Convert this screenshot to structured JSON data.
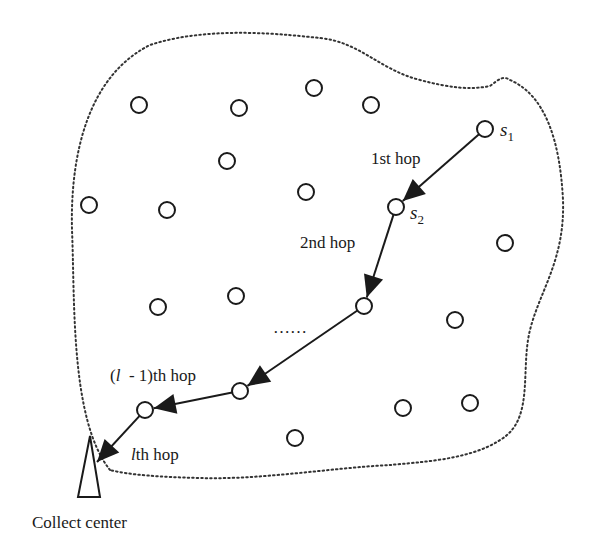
{
  "diagram": {
    "colors": {
      "background": "#ffffff",
      "stroke": "#1a1a1a",
      "boundary": "#333333"
    },
    "boundary": {
      "style": "dotted",
      "path": "M 110 470 C 70 420, 75 300, 72 230 C 70 150, 90 75, 150 45 C 210 25, 290 35, 320 38 C 360 42, 380 70, 420 80 C 450 88, 470 90, 490 86 C 498 80, 503 75, 510 80 C 545 95, 560 140, 563 200 C 565 260, 540 290, 530 330 C 520 370, 535 420, 500 440 C 470 460, 420 462, 390 465 C 330 468, 260 480, 200 478 C 160 477, 130 475, 110 470 Z"
    },
    "nodes": [
      {
        "id": "n1",
        "x": 139,
        "y": 105
      },
      {
        "id": "n2",
        "x": 239,
        "y": 108
      },
      {
        "id": "n3",
        "x": 314,
        "y": 88
      },
      {
        "id": "n4",
        "x": 371,
        "y": 105
      },
      {
        "id": "s1",
        "x": 485,
        "y": 129,
        "label": "s",
        "subscript": "1"
      },
      {
        "id": "n5",
        "x": 227,
        "y": 161
      },
      {
        "id": "n6",
        "x": 306,
        "y": 192
      },
      {
        "id": "n7",
        "x": 89,
        "y": 205
      },
      {
        "id": "n8",
        "x": 167,
        "y": 210
      },
      {
        "id": "s2",
        "x": 396,
        "y": 207,
        "label": "s",
        "subscript": "2"
      },
      {
        "id": "n9",
        "x": 505,
        "y": 243
      },
      {
        "id": "n10",
        "x": 158,
        "y": 307
      },
      {
        "id": "n11",
        "x": 236,
        "y": 296
      },
      {
        "id": "h3",
        "x": 364,
        "y": 306
      },
      {
        "id": "n12",
        "x": 455,
        "y": 320
      },
      {
        "id": "h4",
        "x": 240,
        "y": 391
      },
      {
        "id": "h5",
        "x": 145,
        "y": 410
      },
      {
        "id": "n13",
        "x": 403,
        "y": 408
      },
      {
        "id": "n14",
        "x": 470,
        "y": 403
      },
      {
        "id": "n15",
        "x": 295,
        "y": 438
      }
    ],
    "hops": [
      {
        "from": "s1",
        "to": "s2",
        "label": "1st hop",
        "label_x": 360,
        "label_y": 163
      },
      {
        "from": "s2",
        "to": "h3",
        "label": "2nd hop",
        "label_x": 300,
        "label_y": 248
      },
      {
        "from": "h3",
        "to": "h4",
        "label": "",
        "label_x": 0,
        "label_y": 0
      },
      {
        "from": "h4",
        "to": "h5",
        "label": "(l - 1)th hop",
        "label_x": 110,
        "label_y": 378
      },
      {
        "from": "h5",
        "to": "sink",
        "label": "lth hop",
        "label_x": 130,
        "label_y": 457
      }
    ],
    "hop_labels": {
      "first": "1st hop",
      "second": "2nd hop",
      "l_minus_1_prefix": "(",
      "l_minus_1_var": "l",
      "l_minus_1_suffix": "  - 1)th hop",
      "lth_var": "l",
      "lth_suffix": "th hop"
    },
    "ellipsis": "……",
    "sink": {
      "label": "Collect center",
      "shape": "triangle",
      "points": "78,497 100,497 90,436"
    },
    "node_labels": {
      "s1_main": "s",
      "s1_sub": "1",
      "s2_main": "s",
      "s2_sub": "2"
    }
  }
}
